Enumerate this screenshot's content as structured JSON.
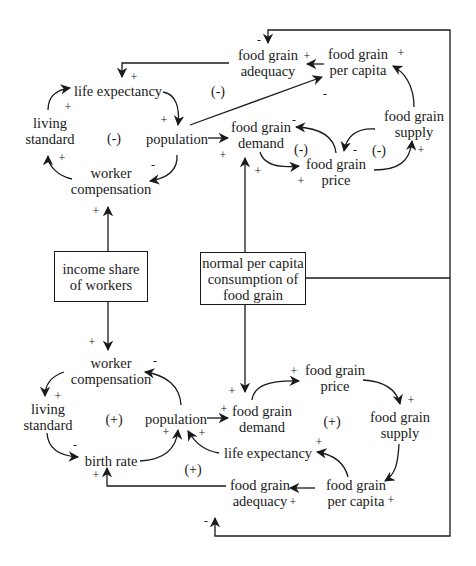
{
  "diagram": {
    "type": "causal-loop-diagram",
    "top_section": {
      "nodes": {
        "life_expectancy": "life expectancy",
        "living_standard": "living\nstandard",
        "population": "population",
        "worker_compensation": "worker\ncompensation",
        "food_grain_adequacy": "food grain\nadequacy",
        "food_grain_per_capita": "food grain\nper capita",
        "food_grain_demand": "food grain\ndemand",
        "food_grain_price": "food grain\nprice",
        "food_grain_supply": "food grain\nsupply"
      },
      "loop_polarities": [
        "(-)",
        "(-)",
        "(-)",
        "(-)"
      ]
    },
    "exogenous": {
      "income_share": "income share\nof workers",
      "normal_consumption": "normal per capita\nconsumption of\nfood grain"
    },
    "bottom_section": {
      "nodes": {
        "worker_compensation": "worker\ncompensation",
        "living_standard": "living\nstandard",
        "population": "population",
        "birth_rate": "birth rate",
        "food_grain_demand": "food grain\ndemand",
        "food_grain_price": "food grain\nprice",
        "food_grain_supply": "food grain\nsupply",
        "life_expectancy": "life expectancy",
        "food_grain_per_capita": "food grain\nper capita",
        "food_grain_adequacy": "food grain\nadequacy"
      },
      "loop_polarities": [
        "(+)",
        "(+)",
        "(+)"
      ]
    },
    "signs": {
      "plus": "+",
      "minus": "-"
    }
  }
}
